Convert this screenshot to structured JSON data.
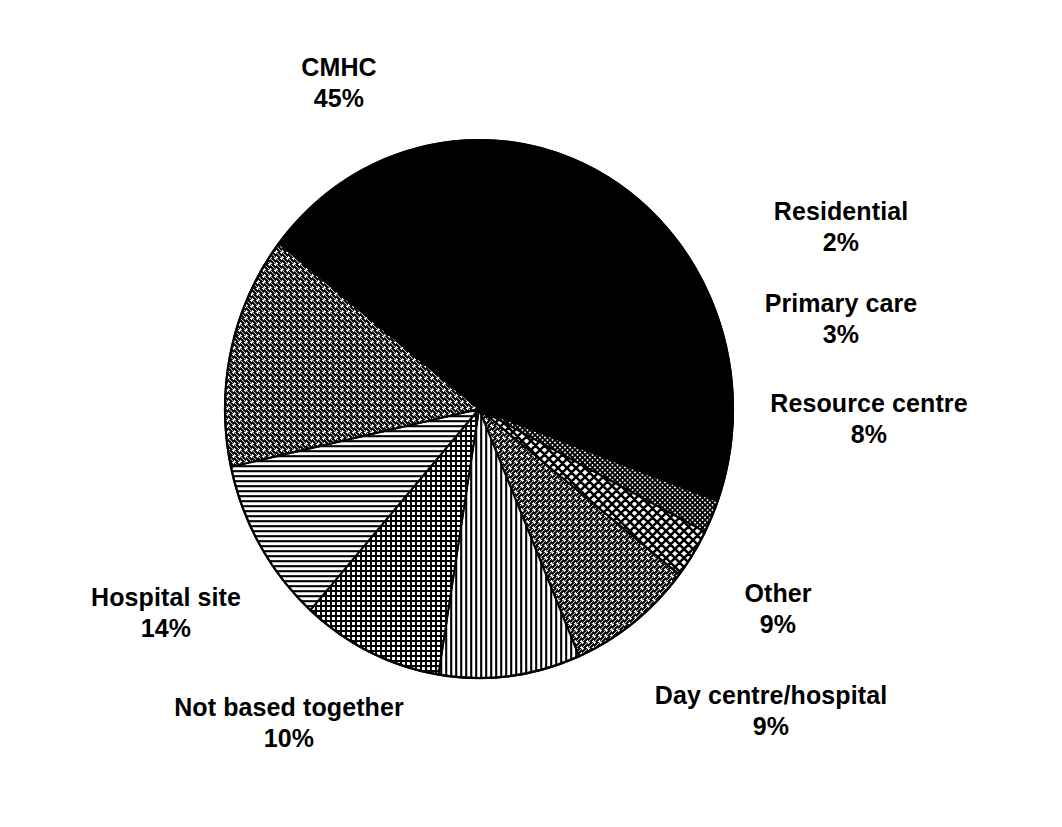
{
  "chart_data": {
    "type": "pie",
    "title": "",
    "subtitle": "",
    "xlabel": "",
    "ylabel": "",
    "legend_position": "none",
    "grid": false,
    "value_unit": "%",
    "categories": [
      "CMHC",
      "Residential",
      "Primary care",
      "Resource centre",
      "Other",
      "Day centre/hospital",
      "Not based together",
      "Hospital site"
    ],
    "values": [
      45,
      2,
      3,
      8,
      9,
      9,
      10,
      14
    ],
    "slices": [
      {
        "label": "CMHC",
        "value": 45,
        "value_text": "45%",
        "fill": "solid-black",
        "color": "#000000",
        "start_angle": -20,
        "sweep": 162
      },
      {
        "label": "Residential",
        "value": 2,
        "value_text": "2%",
        "fill": "fine-crosshatch",
        "color": "#000000",
        "start_angle": -27.2,
        "sweep": 7.2
      },
      {
        "label": "Primary care",
        "value": 3,
        "value_text": "3%",
        "fill": "diamond-crosshatch",
        "color": "#000000",
        "start_angle": -38,
        "sweep": 10.8
      },
      {
        "label": "Resource centre",
        "value": 8,
        "value_text": "8%",
        "fill": "diagonal-up",
        "color": "#000000",
        "start_angle": -66.8,
        "sweep": 28.8
      },
      {
        "label": "Other",
        "value": 9,
        "value_text": "9%",
        "fill": "vertical-lines",
        "color": "#000000",
        "start_angle": -99.2,
        "sweep": 32.4
      },
      {
        "label": "Day centre/hospital",
        "value": 9,
        "value_text": "9%",
        "fill": "fine-grid",
        "color": "#000000",
        "start_angle": -131.6,
        "sweep": 32.4
      },
      {
        "label": "Not based together",
        "value": 10,
        "value_text": "10%",
        "fill": "horizontal-lines",
        "color": "#000000",
        "start_angle": -167.6,
        "sweep": 36
      },
      {
        "label": "Hospital site",
        "value": 14,
        "value_text": "14%",
        "fill": "diagonal-down",
        "color": "#000000",
        "start_angle": -218,
        "sweep": 50.4
      }
    ],
    "geometry": {
      "center_x": 479,
      "center_y": 409,
      "radius_x": 254,
      "radius_y": 269,
      "outline_color": "#000000",
      "background": "#ffffff"
    }
  },
  "labels": {
    "cmhc": {
      "name": "CMHC",
      "value": "45%"
    },
    "residential": {
      "name": "Residential",
      "value": "2%"
    },
    "primary_care": {
      "name": "Primary care",
      "value": "3%"
    },
    "resource_centre": {
      "name": "Resource centre",
      "value": "8%"
    },
    "other": {
      "name": "Other",
      "value": "9%"
    },
    "day_centre_hospital": {
      "name": "Day centre/hospital",
      "value": "9%"
    },
    "not_based_together": {
      "name": "Not based together",
      "value": "10%"
    },
    "hospital_site": {
      "name": "Hospital site",
      "value": "14%"
    }
  }
}
